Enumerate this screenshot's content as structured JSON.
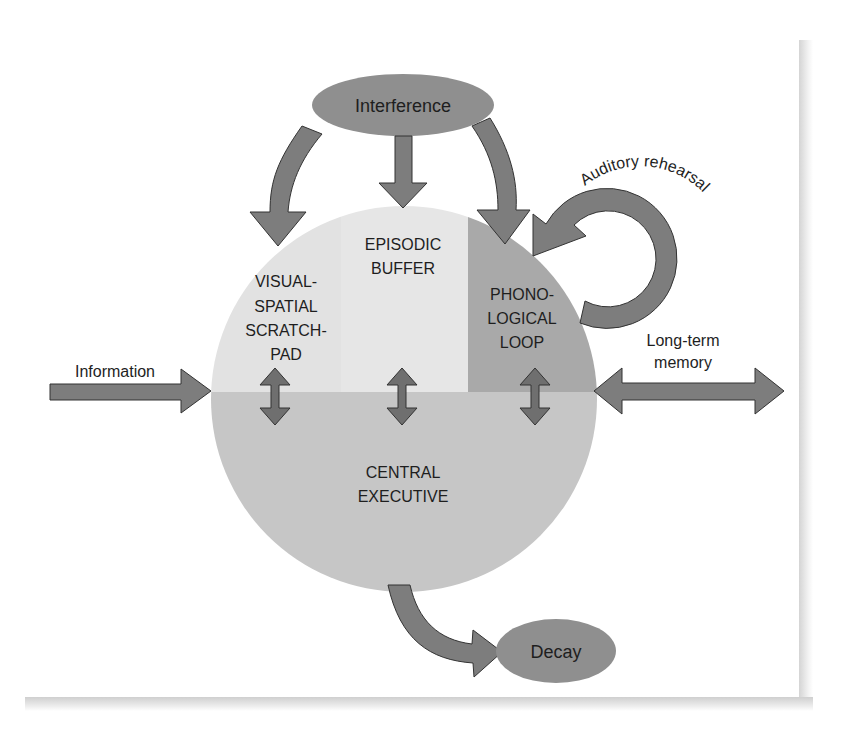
{
  "diagram": {
    "title_hint": "Working memory model",
    "colors": {
      "background": "#ffffff",
      "visual_spatial_region": "#e2e2e2",
      "episodic_region": "#e6e6e6",
      "phonological_region": "#a9a9a9",
      "central_executive_region": "#c6c6c6",
      "arrow_fill": "#7d7d7d",
      "arrow_stroke": "#333333",
      "ellipse_fill": "#8f8f8f",
      "text": "#1e1e1e"
    },
    "nodes": {
      "interference": "Interference",
      "decay": "Decay",
      "visual_spatial": [
        "VISUAL-",
        "SPATIAL",
        "SCRATCH-",
        "PAD"
      ],
      "episodic_buffer": [
        "EPISODIC",
        "BUFFER"
      ],
      "phonological_loop": [
        "PHONO-",
        "LOGICAL",
        "LOOP"
      ],
      "central_executive": [
        "CENTRAL",
        "EXECUTIVE"
      ]
    },
    "edge_labels": {
      "information": "Information",
      "long_term_memory": [
        "Long-term",
        "memory"
      ],
      "auditory_rehearsal": "Auditory rehearsal"
    },
    "edges": [
      {
        "from": "Interference",
        "to": "VISUAL-SPATIAL SCRATCHPAD",
        "type": "curved-arrow"
      },
      {
        "from": "Interference",
        "to": "EPISODIC BUFFER",
        "type": "arrow"
      },
      {
        "from": "Interference",
        "to": "PHONOLOGICAL LOOP",
        "type": "curved-arrow"
      },
      {
        "from": "PHONOLOGICAL LOOP",
        "to": "PHONOLOGICAL LOOP",
        "label": "Auditory rehearsal",
        "type": "loop-arrow"
      },
      {
        "from": "Information",
        "to": "Working memory",
        "type": "arrow"
      },
      {
        "from": "Working memory",
        "to": "Long-term memory",
        "type": "double-arrow"
      },
      {
        "from": "VISUAL-SPATIAL SCRATCHPAD",
        "to": "CENTRAL EXECUTIVE",
        "type": "double-arrow"
      },
      {
        "from": "EPISODIC BUFFER",
        "to": "CENTRAL EXECUTIVE",
        "type": "double-arrow"
      },
      {
        "from": "PHONOLOGICAL LOOP",
        "to": "CENTRAL EXECUTIVE",
        "type": "double-arrow"
      },
      {
        "from": "CENTRAL EXECUTIVE",
        "to": "Decay",
        "type": "curved-arrow"
      }
    ]
  }
}
